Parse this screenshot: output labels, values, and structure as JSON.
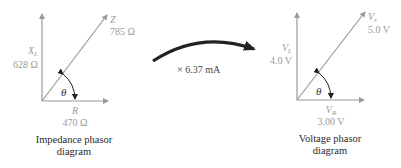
{
  "impedance_diagram": {
    "hyp": {
      "symbol": "Z",
      "value": "785 Ω"
    },
    "vertical": {
      "symbol": "X",
      "sub": "L",
      "value": "628 Ω"
    },
    "horizontal": {
      "symbol": "R",
      "value": "470 Ω"
    },
    "angle": "θ",
    "caption_line1": "Impedance phasor",
    "caption_line2": "diagram"
  },
  "transform": {
    "label": "× 6.37 mA"
  },
  "voltage_diagram": {
    "hyp": {
      "symbol": "V",
      "sub": "s",
      "value": "5.0 V"
    },
    "vertical": {
      "symbol": "V",
      "sub": "L",
      "value": "4.0 V"
    },
    "horizontal": {
      "symbol": "V",
      "sub": "R",
      "value": "3.00 V"
    },
    "angle": "θ",
    "caption_line1": "Voltage phasor",
    "caption_line2": "diagram"
  },
  "colors": {
    "axis": "#9a9a9a",
    "arrow": "#222222",
    "label": "#9a9a9a",
    "caption": "#2a2a2a"
  }
}
